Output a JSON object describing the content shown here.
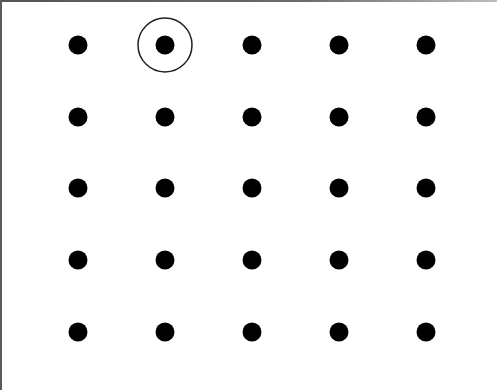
{
  "diagram": {
    "type": "dot-grid",
    "rows": 5,
    "columns": 5,
    "dot_color": "#000000",
    "dot_radius": 9.5,
    "background": "#ffffff",
    "column_x": [
      78,
      165,
      252,
      339,
      426
    ],
    "row_y": [
      45,
      117,
      188,
      260,
      332
    ],
    "highlighted": {
      "row": 0,
      "column": 1,
      "ring_radius": 27,
      "ring_color": "#222222",
      "ring_width": 1.5
    }
  }
}
